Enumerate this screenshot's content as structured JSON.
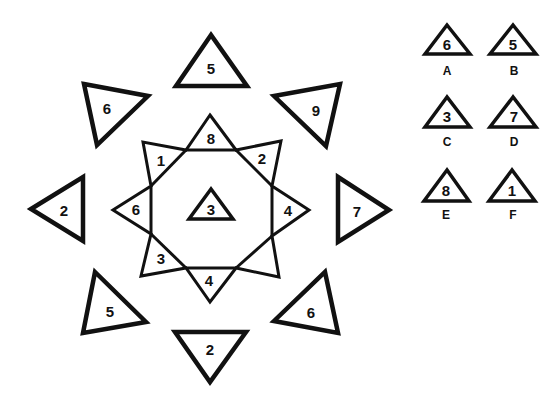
{
  "puzzle": {
    "outer_triangles": [
      {
        "position": "top",
        "value": "5"
      },
      {
        "position": "top-left",
        "value": "6"
      },
      {
        "position": "top-right",
        "value": "9"
      },
      {
        "position": "left",
        "value": "2"
      },
      {
        "position": "right",
        "value": "7"
      },
      {
        "position": "bottom-left",
        "value": "5"
      },
      {
        "position": "bottom-right",
        "value": "6"
      },
      {
        "position": "bottom",
        "value": "2"
      }
    ],
    "star_points": [
      {
        "position": "top",
        "value": "8"
      },
      {
        "position": "top-right",
        "value": "2"
      },
      {
        "position": "right",
        "value": "4"
      },
      {
        "position": "bottom-right",
        "value": ""
      },
      {
        "position": "bottom",
        "value": "4"
      },
      {
        "position": "bottom-left",
        "value": "3"
      },
      {
        "position": "left",
        "value": "6"
      },
      {
        "position": "top-left",
        "value": "1"
      }
    ],
    "center_triangle": {
      "value": "3"
    }
  },
  "options": [
    {
      "letter": "A",
      "value": "6"
    },
    {
      "letter": "B",
      "value": "5"
    },
    {
      "letter": "C",
      "value": "3"
    },
    {
      "letter": "D",
      "value": "7"
    },
    {
      "letter": "E",
      "value": "8"
    },
    {
      "letter": "F",
      "value": "1"
    }
  ]
}
